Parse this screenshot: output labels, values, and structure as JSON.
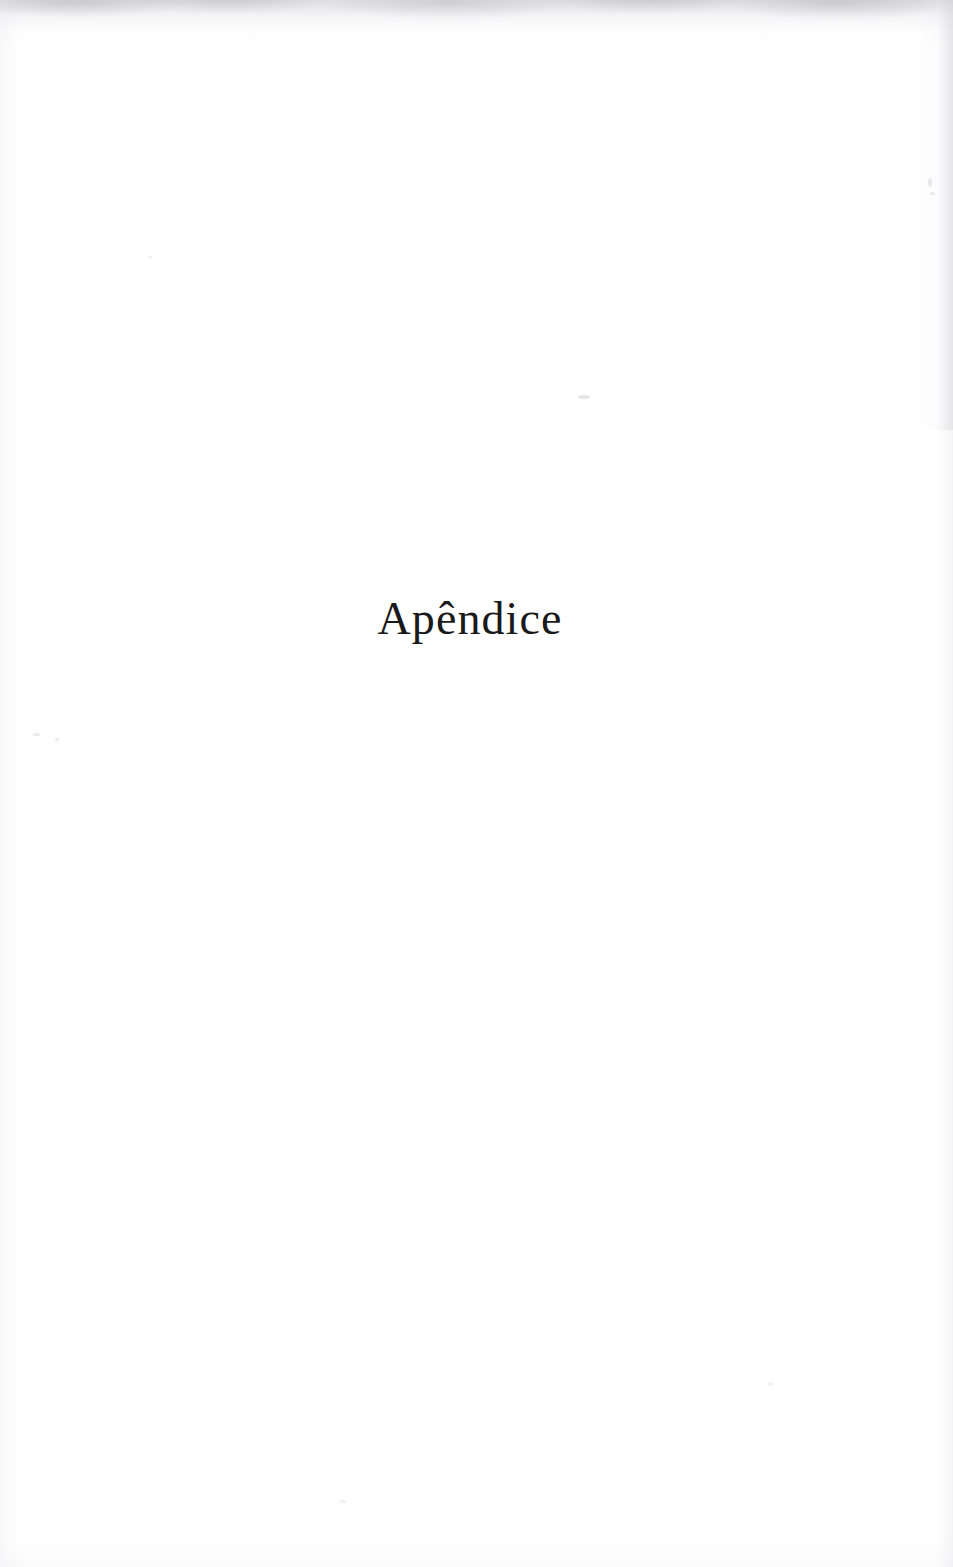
{
  "document": {
    "type": "scanned-book-page",
    "language": "pt",
    "page_width": 953,
    "page_height": 1567,
    "background_color": "#ffffff",
    "ink_color": "#1a1a1a"
  },
  "page": {
    "heading": "Apêndice",
    "body_text": "",
    "page_number": "",
    "header": "",
    "footer": ""
  },
  "artifacts": {
    "top_edge_shadow": "scan-edge-shadow-top",
    "right_edge_shadow": "scan-edge-shadow-right",
    "left_edge_shadow": "scan-edge-shadow-left",
    "bottom_edge_shadow": "scan-edge-shadow-bottom",
    "dust_specks": [
      "speck-center",
      "speck-right-upper",
      "speck-right-upper-2",
      "speck-left-mid",
      "speck-left-mid-2",
      "speck-lower-left",
      "speck-lower-right",
      "speck-upper-left"
    ]
  }
}
